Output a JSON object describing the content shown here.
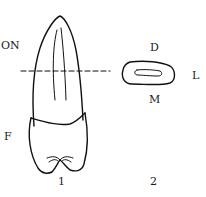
{
  "figure": {
    "labels": {
      "occlusal_notch": "ON",
      "facial": "F",
      "distal": "D",
      "lingual": "L",
      "mesial": "M"
    },
    "panels": [
      {
        "number": "1",
        "description": "tooth lateral view"
      },
      {
        "number": "2",
        "description": "cross-section at dashed line"
      }
    ],
    "colors": {
      "line": "#111111",
      "background": "#ffffff"
    }
  }
}
